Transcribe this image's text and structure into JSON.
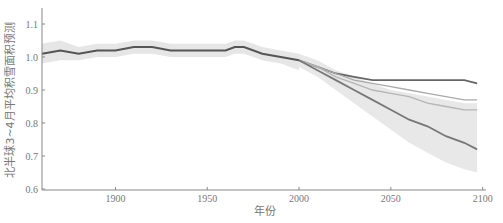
{
  "chart_data": {
    "type": "line",
    "title": "",
    "xlabel": "年份",
    "ylabel": "北半球3~4月平均积雪面积预测",
    "xlim": [
      1860,
      2100
    ],
    "ylim": [
      0.6,
      1.15
    ],
    "xticks": [
      1900,
      1950,
      2000,
      2050,
      2100
    ],
    "yticks": [
      0.6,
      0.7,
      0.8,
      0.9,
      1.0,
      1.1
    ],
    "grid": false,
    "legend": null,
    "historical": {
      "name": "historical",
      "x": [
        1860,
        1870,
        1880,
        1890,
        1900,
        1910,
        1920,
        1930,
        1940,
        1950,
        1960,
        1965,
        1970,
        1980,
        1990,
        2000
      ],
      "values": [
        1.01,
        1.02,
        1.01,
        1.02,
        1.02,
        1.03,
        1.03,
        1.02,
        1.02,
        1.02,
        1.02,
        1.03,
        1.03,
        1.01,
        1.0,
        0.99
      ],
      "band_lower": [
        0.98,
        0.99,
        0.99,
        1.0,
        1.0,
        1.01,
        1.01,
        1.0,
        1.0,
        1.0,
        1.0,
        1.01,
        1.01,
        0.99,
        0.98,
        0.96
      ],
      "band_upper": [
        1.04,
        1.05,
        1.03,
        1.04,
        1.04,
        1.05,
        1.05,
        1.04,
        1.04,
        1.04,
        1.04,
        1.05,
        1.05,
        1.03,
        1.02,
        1.01
      ]
    },
    "x": [
      2000,
      2010,
      2020,
      2030,
      2040,
      2050,
      2060,
      2070,
      2080,
      2090,
      2097
    ],
    "series": [
      {
        "name": "scenario-low",
        "color": "#666666",
        "values": [
          0.99,
          0.97,
          0.95,
          0.94,
          0.93,
          0.93,
          0.93,
          0.93,
          0.93,
          0.93,
          0.92
        ]
      },
      {
        "name": "scenario-mid1",
        "color": "#aaaaaa",
        "values": [
          0.99,
          0.97,
          0.95,
          0.93,
          0.92,
          0.91,
          0.9,
          0.89,
          0.88,
          0.87,
          0.87
        ]
      },
      {
        "name": "scenario-mid2",
        "color": "#b5b5b5",
        "values": [
          0.99,
          0.97,
          0.94,
          0.92,
          0.9,
          0.89,
          0.88,
          0.86,
          0.85,
          0.84,
          0.84
        ]
      },
      {
        "name": "scenario-high",
        "color": "#777777",
        "values": [
          0.99,
          0.96,
          0.93,
          0.9,
          0.87,
          0.84,
          0.81,
          0.79,
          0.76,
          0.74,
          0.72
        ]
      }
    ],
    "high_band": {
      "lower": [
        0.97,
        0.94,
        0.9,
        0.86,
        0.82,
        0.78,
        0.74,
        0.71,
        0.68,
        0.66,
        0.65
      ],
      "upper": [
        1.01,
        0.99,
        0.96,
        0.94,
        0.92,
        0.9,
        0.89,
        0.88,
        0.87,
        0.86,
        0.86
      ]
    }
  },
  "axes": {
    "x_tick_labels": [
      "1900",
      "1950",
      "2000",
      "2050",
      "2100"
    ],
    "y_tick_labels": [
      "0.6",
      "0.7",
      "0.8",
      "0.9",
      "1.0",
      "1.1"
    ],
    "xlabel": "年份",
    "ylabel": "北半球3~4月平均积雪面积预测"
  }
}
